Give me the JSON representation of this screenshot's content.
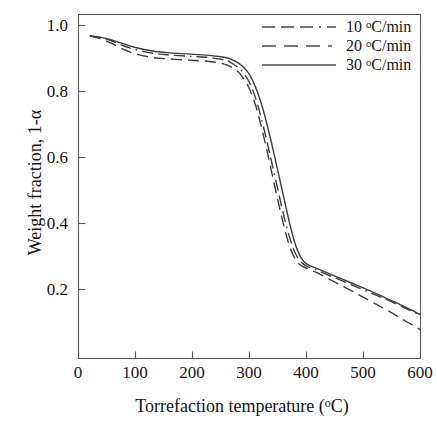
{
  "chart_data": {
    "type": "line",
    "title": "",
    "xlabel": "Torrefaction temperature (oC)",
    "ylabel": "Weight fraction, 1-α",
    "xlim": [
      0,
      600
    ],
    "ylim": [
      0.1,
      1.06
    ],
    "grid": false,
    "legend_position": "top-right",
    "xticks": [
      0,
      100,
      200,
      300,
      400,
      500,
      600
    ],
    "xtick_labels": [
      "0",
      "100",
      "200",
      "300",
      "400",
      "500",
      "600"
    ],
    "yticks": [
      0.2,
      0.4,
      0.6,
      0.8,
      1.0
    ],
    "ytick_labels": [
      "0.2",
      "0.4",
      "0.6",
      "0.8",
      "1.0"
    ],
    "series": [
      {
        "name": "10 oC/min",
        "label_value": "10",
        "label_unit": "C/min",
        "style": "dash-dot",
        "color": "#3d3d3d",
        "x": [
          20,
          40,
          60,
          80,
          100,
          130,
          160,
          190,
          210,
          230,
          250,
          265,
          280,
          290,
          300,
          310,
          320,
          330,
          340,
          350,
          360,
          370,
          380,
          390,
          400,
          420,
          450,
          480,
          510,
          540,
          570,
          600
        ],
        "y": [
          1.0,
          0.995,
          0.985,
          0.972,
          0.962,
          0.952,
          0.947,
          0.944,
          0.942,
          0.94,
          0.935,
          0.928,
          0.912,
          0.895,
          0.87,
          0.83,
          0.775,
          0.71,
          0.64,
          0.57,
          0.5,
          0.44,
          0.395,
          0.37,
          0.358,
          0.345,
          0.325,
          0.305,
          0.285,
          0.265,
          0.243,
          0.22
        ]
      },
      {
        "name": "20 oC/min",
        "label_value": "20",
        "label_unit": "C/min",
        "style": "dashed",
        "color": "#3d3d3d",
        "x": [
          20,
          40,
          60,
          80,
          100,
          130,
          160,
          190,
          210,
          230,
          250,
          265,
          280,
          290,
          300,
          310,
          320,
          330,
          340,
          350,
          360,
          370,
          380,
          390,
          400,
          420,
          450,
          480,
          510,
          540,
          570,
          600
        ],
        "y": [
          1.0,
          0.992,
          0.978,
          0.962,
          0.95,
          0.94,
          0.936,
          0.933,
          0.931,
          0.929,
          0.924,
          0.916,
          0.9,
          0.88,
          0.852,
          0.81,
          0.752,
          0.685,
          0.612,
          0.54,
          0.472,
          0.415,
          0.378,
          0.36,
          0.352,
          0.338,
          0.313,
          0.288,
          0.262,
          0.236,
          0.208,
          0.18
        ]
      },
      {
        "name": "30 oC/min",
        "label_value": "30",
        "label_unit": "C/min",
        "style": "solid",
        "color": "#3d3d3d",
        "x": [
          20,
          40,
          60,
          80,
          100,
          130,
          160,
          190,
          210,
          230,
          250,
          265,
          280,
          290,
          300,
          310,
          320,
          330,
          340,
          350,
          360,
          370,
          380,
          390,
          400,
          420,
          450,
          480,
          510,
          540,
          570,
          600
        ],
        "y": [
          1.0,
          0.996,
          0.988,
          0.978,
          0.968,
          0.958,
          0.953,
          0.95,
          0.948,
          0.946,
          0.942,
          0.937,
          0.925,
          0.912,
          0.892,
          0.86,
          0.815,
          0.758,
          0.692,
          0.622,
          0.55,
          0.48,
          0.42,
          0.382,
          0.364,
          0.35,
          0.33,
          0.31,
          0.29,
          0.268,
          0.246,
          0.222
        ]
      }
    ]
  },
  "axes": {
    "y_title_prefix": "Weight fraction, 1-",
    "y_title_symbol": "α",
    "x_title_prefix": "Torrefaction temperature (",
    "x_title_deg": "o",
    "x_title_suffix": "C)"
  },
  "legend": {
    "entries": [
      {
        "value": "10 ",
        "deg": "o",
        "unit": "C/min"
      },
      {
        "value": "20 ",
        "deg": "o",
        "unit": "C/min"
      },
      {
        "value": "30 ",
        "deg": "o",
        "unit": "C/min"
      }
    ]
  }
}
